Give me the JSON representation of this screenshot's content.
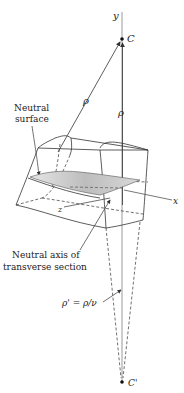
{
  "labels": {
    "y_axis": "y",
    "x_axis": "x",
    "z_axis": "z",
    "center": "C",
    "center_prime": "C'",
    "rho_slanted": "ρ",
    "rho_vertical": "ρ",
    "neutral_surface_line1": "Neutral",
    "neutral_surface_line2": "surface",
    "neutral_axis_line1": "Neutral axis of",
    "neutral_axis_line2": "transverse section",
    "rho_prime_eq": "ρ' = ρ/ν"
  },
  "colors": {
    "line": "#333333",
    "axis": "#8a8a8a",
    "surface_fill": "#c8c8c8"
  }
}
